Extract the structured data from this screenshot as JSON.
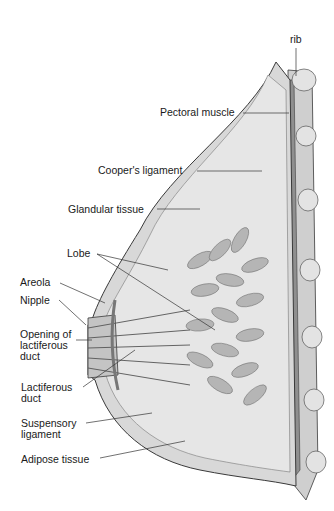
{
  "figure": {
    "colors": {
      "background": "#ffffff",
      "tissue_light": "#d8d8d8",
      "tissue_mid": "#b5b5b5",
      "muscle": "#8f8f8f",
      "outline": "#3a3a3a",
      "label_text": "#1a1a1a"
    }
  },
  "labels": {
    "rib": "rib",
    "pectoral_muscle": "Pectoral muscle",
    "coopers_ligament": "Cooper's ligament",
    "glandular_tissue": "Glandular tissue",
    "lobe": "Lobe",
    "areola": "Areola",
    "nipple": "Nipple",
    "opening_of_lactiferous_duct": "Opening of\nlactiferous\nduct",
    "lactiferous_duct": "Lactiferous\nduct",
    "suspensory_ligament": "Suspensory\nligament",
    "adipose_tissue": "Adipose tissue"
  }
}
